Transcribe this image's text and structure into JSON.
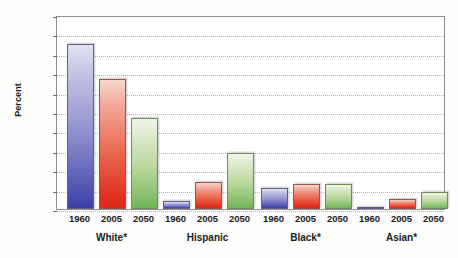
{
  "chart_data": {
    "type": "bar",
    "title": "",
    "subtitle": "",
    "xlabel": "",
    "ylabel": "Percent",
    "ylim": [
      0,
      100
    ],
    "ytick_step": 10,
    "yticks": [
      0,
      10,
      20,
      30,
      40,
      50,
      60,
      70,
      80,
      90,
      100
    ],
    "ytick_labels": [
      "0",
      "10",
      "20",
      "30",
      "40",
      "50",
      "60",
      "70",
      "80",
      "90",
      "100"
    ],
    "grid": true,
    "grid_style": "dotted",
    "legend": false,
    "legend_position": "none",
    "categories": [
      "White*",
      "Hispanic",
      "Black*",
      "Asian*"
    ],
    "x": [
      "1960",
      "2005",
      "2050"
    ],
    "series": [
      {
        "name": "1960",
        "color": "#4a4fae",
        "values": [
          85,
          4,
          11,
          1
        ]
      },
      {
        "name": "2005",
        "color": "#e03323",
        "values": [
          67,
          14,
          13,
          5
        ]
      },
      {
        "name": "2050",
        "color": "#84bd6a",
        "values": [
          47,
          29,
          13,
          9
        ]
      }
    ],
    "groups": [
      {
        "label": "White*",
        "bars": [
          {
            "year": "1960",
            "value": 85,
            "color": "blue"
          },
          {
            "year": "2005",
            "value": 67,
            "color": "red"
          },
          {
            "year": "2050",
            "value": 47,
            "color": "green"
          }
        ]
      },
      {
        "label": "Hispanic",
        "bars": [
          {
            "year": "1960",
            "value": 4,
            "color": "blue"
          },
          {
            "year": "2005",
            "value": 14,
            "color": "red"
          },
          {
            "year": "2050",
            "value": 29,
            "color": "green"
          }
        ]
      },
      {
        "label": "Black*",
        "bars": [
          {
            "year": "1960",
            "value": 11,
            "color": "blue"
          },
          {
            "year": "2005",
            "value": 13,
            "color": "red"
          },
          {
            "year": "2050",
            "value": 13,
            "color": "green"
          }
        ]
      },
      {
        "label": "Asian*",
        "bars": [
          {
            "year": "1960",
            "value": 1,
            "color": "blue"
          },
          {
            "year": "2005",
            "value": 5,
            "color": "red"
          },
          {
            "year": "2050",
            "value": 9,
            "color": "green"
          }
        ]
      }
    ],
    "colors": {
      "series_1960": "#4a4fae",
      "series_2005": "#e03323",
      "series_2050": "#84bd6a",
      "gridline": "#9aa6c4",
      "axis": "#8d8f92",
      "text": "#1b1b1b",
      "plot_background": "#ffffff",
      "page_background": "#fdfdfc"
    }
  }
}
